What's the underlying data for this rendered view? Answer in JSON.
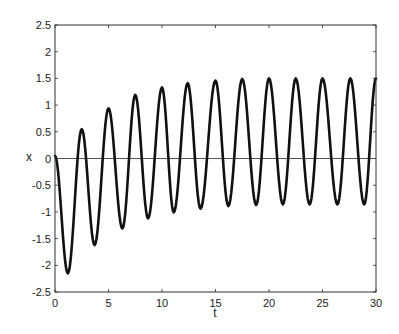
{
  "chart_data": {
    "type": "line",
    "title": "",
    "xlabel": "t",
    "ylabel": "x",
    "xlim": [
      0,
      30
    ],
    "ylim": [
      -2.5,
      2.5
    ],
    "grid": false,
    "legend": null,
    "xticks": [
      0,
      5,
      10,
      15,
      20,
      25,
      30
    ],
    "xtick_labels": [
      "0",
      "5",
      "10",
      "15",
      "20",
      "25",
      "30"
    ],
    "yticks": [
      -2.5,
      -2,
      -1.5,
      -1,
      -0.5,
      0,
      0.5,
      1,
      1.5,
      2,
      2.5
    ],
    "ytick_labels": [
      "-2.5",
      "-2",
      "-1.5",
      "-1",
      "-0.5",
      "0",
      "0.5",
      "1",
      "1.5",
      "2",
      "2.5"
    ],
    "reference_line": {
      "y": 0,
      "color": "#555555"
    },
    "series": [
      {
        "name": "x(t)",
        "color": "#111111",
        "extrema": {
          "t": [
            0,
            1.2,
            2.5,
            3.7,
            5.0,
            6.3,
            7.5,
            8.7,
            10.0,
            11.1,
            12.4,
            13.6,
            15.0,
            16.2,
            17.5,
            18.8,
            20.0,
            21.3,
            22.5,
            23.8,
            25.0,
            26.4,
            27.6,
            28.9,
            30.0
          ],
          "x": [
            0.05,
            -2.15,
            0.55,
            -1.62,
            0.94,
            -1.31,
            1.19,
            -1.12,
            1.33,
            -1.01,
            1.41,
            -0.94,
            1.46,
            -0.89,
            1.49,
            -0.87,
            1.5,
            -0.86,
            1.5,
            -0.86,
            1.5,
            -0.86,
            1.5,
            -0.86,
            1.5
          ]
        }
      }
    ]
  }
}
